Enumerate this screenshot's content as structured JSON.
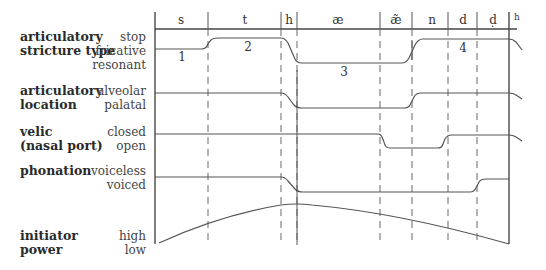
{
  "rows": [
    {
      "title": [
        "articulatory",
        "stricture type"
      ],
      "values": [
        "stop",
        "fricative",
        "resonant"
      ]
    },
    {
      "title": [
        "articulatory",
        "location"
      ],
      "values": [
        "alveolar",
        "palatal"
      ]
    },
    {
      "title": [
        "velic",
        "(nasal port)"
      ],
      "values": [
        "closed",
        "open"
      ]
    },
    {
      "title": [
        "phonation"
      ],
      "values": [
        "voiceless",
        "voiced"
      ]
    },
    {
      "title": [
        "initiator",
        "power"
      ],
      "values": [
        "high",
        "low"
      ]
    }
  ],
  "segments": [
    "s",
    "t",
    "h",
    "æ",
    "æ̃",
    "n",
    "d",
    "ḍ",
    "h"
  ],
  "numbers": [
    "1",
    "2",
    "3",
    "4"
  ]
}
